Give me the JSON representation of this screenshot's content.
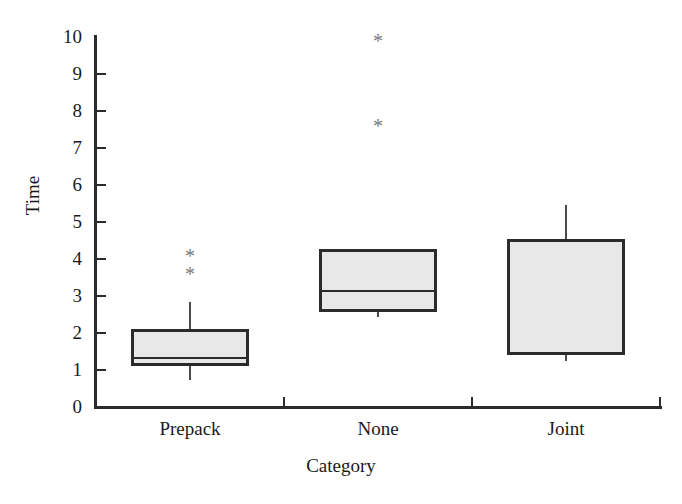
{
  "chart_data": {
    "type": "box",
    "title": "",
    "xlabel": "Category",
    "ylabel": "Time",
    "categories": [
      "Prepack",
      "None",
      "Joint"
    ],
    "ylim": [
      0,
      10
    ],
    "ytick_labels": [
      "0",
      "1",
      "2",
      "3",
      "4",
      "5",
      "6",
      "7",
      "8",
      "9",
      "10"
    ],
    "ytick_values": [
      0,
      1,
      2,
      3,
      4,
      5,
      6,
      7,
      8,
      9,
      10
    ],
    "grid": false,
    "legend": null,
    "box_fill_color": "#e8e8e8",
    "box_edge_color": "#2b2b2b",
    "outlier_marker": "*",
    "boxes": [
      {
        "category": "Prepack",
        "whisker_high": 2.85,
        "q3": 2.12,
        "median": 1.35,
        "q1": 1.12,
        "whisker_low": 0.72,
        "outliers": [
          4.16,
          3.68
        ]
      },
      {
        "category": "None",
        "whisker_high": 4.27,
        "q3": 4.27,
        "median": 3.17,
        "q1": 2.58,
        "whisker_low": 2.42,
        "outliers": [
          9.98,
          7.68
        ]
      },
      {
        "category": "Joint",
        "whisker_high": 5.45,
        "q3": 4.54,
        "median": 1.45,
        "q1": 1.41,
        "whisker_low": 1.25,
        "outliers": []
      }
    ]
  }
}
